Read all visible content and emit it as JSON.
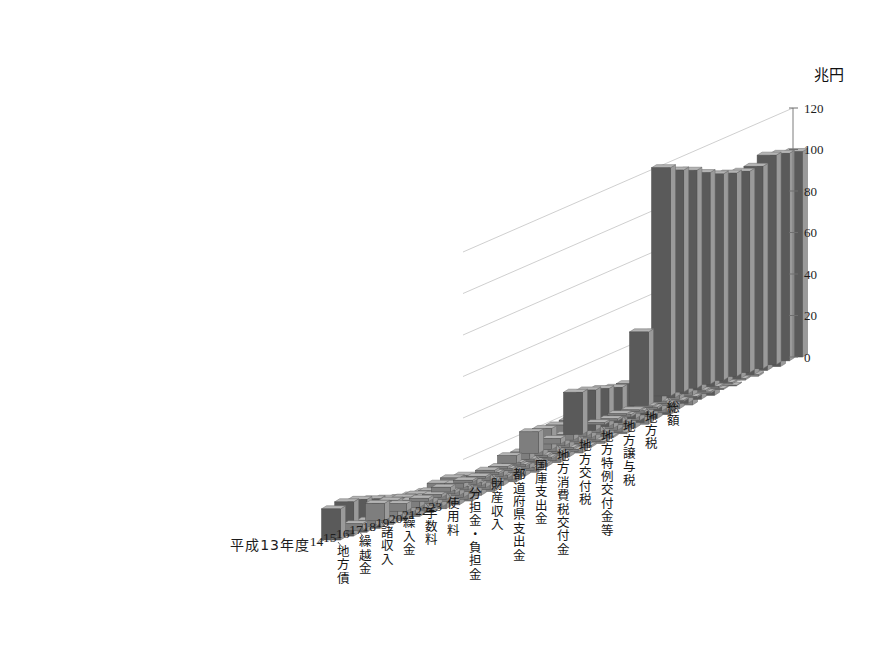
{
  "chart_data": {
    "type": "bar",
    "subtype": "3d-grouped-bar",
    "title": "",
    "unit_label": "兆円",
    "ylabel": "兆円",
    "xlabel": "",
    "zlabel": "",
    "ylim": [
      0,
      120
    ],
    "yticks": [
      0,
      20,
      40,
      60,
      80,
      100,
      120
    ],
    "grid": true,
    "legend": "none",
    "x_axis_name": "年度",
    "x_first_tick_label": "平成13年度",
    "categories": [
      "13",
      "14",
      "15",
      "16",
      "17",
      "18",
      "19",
      "20",
      "21",
      "22",
      "23"
    ],
    "x": [
      "平成13年度",
      "14",
      "15",
      "16",
      "17",
      "18",
      "19",
      "20",
      "21",
      "22",
      "23"
    ],
    "series": [
      {
        "name": "地方債",
        "values": [
          15.0,
          16.5,
          15.8,
          14.2,
          12.6,
          11.0,
          10.4,
          10.2,
          12.3,
          13.0,
          12.4
        ]
      },
      {
        "name": "繰越金",
        "values": [
          3.2,
          3.0,
          2.9,
          3.0,
          3.1,
          3.2,
          3.3,
          3.1,
          3.4,
          4.2,
          4.4
        ]
      },
      {
        "name": "諸収入",
        "values": [
          8.4,
          8.0,
          7.6,
          7.2,
          6.9,
          6.6,
          6.3,
          6.1,
          6.0,
          5.8,
          5.7
        ]
      },
      {
        "name": "繰入金",
        "values": [
          3.6,
          3.4,
          3.2,
          3.1,
          3.0,
          2.9,
          2.8,
          2.7,
          2.9,
          3.0,
          3.1
        ]
      },
      {
        "name": "手数料",
        "values": [
          1.6,
          1.6,
          1.6,
          1.6,
          1.6,
          1.5,
          1.5,
          1.5,
          1.5,
          1.5,
          1.5
        ]
      },
      {
        "name": "使用料",
        "values": [
          2.3,
          2.3,
          2.2,
          2.2,
          2.2,
          2.1,
          2.1,
          2.1,
          2.0,
          2.0,
          2.0
        ]
      },
      {
        "name": "分担金・負担金",
        "values": [
          1.0,
          1.0,
          1.0,
          1.0,
          1.0,
          0.9,
          0.9,
          0.9,
          0.9,
          0.9,
          0.9
        ]
      },
      {
        "name": "財産収入",
        "values": [
          1.2,
          1.1,
          1.1,
          1.0,
          1.0,
          1.0,
          0.9,
          0.9,
          0.8,
          0.8,
          0.8
        ]
      },
      {
        "name": "都道府県支出金",
        "values": [
          3.6,
          3.5,
          3.4,
          3.3,
          3.4,
          3.4,
          3.5,
          3.6,
          3.9,
          4.0,
          4.1
        ]
      },
      {
        "name": "国庫支出金",
        "values": [
          10.5,
          10.2,
          10.0,
          10.4,
          10.8,
          10.2,
          10.4,
          11.4,
          15.5,
          14.5,
          16.4
        ]
      },
      {
        "name": "地方消費税交付金",
        "values": [
          2.6,
          2.6,
          2.5,
          2.5,
          2.5,
          2.5,
          2.5,
          2.4,
          2.3,
          2.3,
          2.3
        ]
      },
      {
        "name": "地方交付税",
        "values": [
          20.3,
          19.5,
          18.3,
          17.0,
          16.9,
          16.0,
          15.5,
          15.6,
          16.6,
          17.5,
          18.8
        ]
      },
      {
        "name": "地方特例交付金等",
        "values": [
          1.0,
          1.0,
          1.1,
          1.1,
          1.0,
          0.9,
          0.6,
          0.5,
          0.8,
          0.5,
          0.3
        ]
      },
      {
        "name": "地方譲与税",
        "values": [
          0.7,
          0.7,
          0.7,
          1.2,
          1.9,
          3.4,
          0.8,
          0.7,
          0.7,
          0.7,
          0.7
        ]
      },
      {
        "name": "地方税",
        "values": [
          35.5,
          33.4,
          32.5,
          33.1,
          34.8,
          36.5,
          40.3,
          39.6,
          35.0,
          34.3,
          34.1
        ]
      },
      {
        "name": "総額",
        "values": [
          110.0,
          107.0,
          105.0,
          102.0,
          99.5,
          98.0,
          97.0,
          97.5,
          101.0,
          100.0,
          99.0
        ]
      }
    ]
  },
  "axes": {
    "y_unit": "兆円",
    "y_ticks": [
      "0",
      "20",
      "40",
      "60",
      "80",
      "100",
      "120"
    ],
    "year_ticks": [
      "平成13年度",
      "14",
      "15",
      "16",
      "17",
      "18",
      "19",
      "20",
      "21",
      "22",
      "23"
    ],
    "category_ticks": [
      "地方債",
      "繰越金",
      "諸収入",
      "繰入金",
      "手数料",
      "使用料",
      "分担金・負担金",
      "財産収入",
      "都道府県支出金",
      "国庫支出金",
      "地方消費税交付金",
      "地方交付税",
      "地方特例交付金等",
      "地方譲与税",
      "地方税",
      "総額"
    ]
  },
  "colors": {
    "bar_front_dark": "#5a5a5a",
    "bar_front_mid": "#7e7e7e",
    "bar_top": "#b4b4b4",
    "bar_side": "#9a9a9a",
    "gridline": "#c9c9c9",
    "axis": "#7c7c7c",
    "background": "#ffffff",
    "text": "#1a1a1a"
  }
}
